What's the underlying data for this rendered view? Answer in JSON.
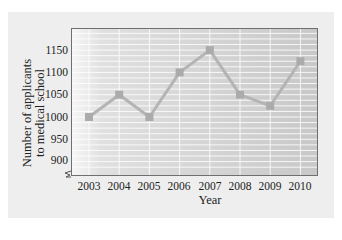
{
  "chart_data": {
    "type": "line",
    "title": "",
    "xlabel": "Year",
    "ylabel": "Number of applicants to medical school",
    "ylabel_lines": [
      "Number of applicants",
      "to medical school"
    ],
    "categories": [
      "2003",
      "2004",
      "2005",
      "2006",
      "2007",
      "2008",
      "2009",
      "2010"
    ],
    "series": [
      {
        "name": "Applicants",
        "values": [
          1000,
          1050,
          1000,
          1100,
          1150,
          1050,
          1025,
          1125
        ]
      }
    ],
    "yticks": [
      "900",
      "950",
      "1000",
      "1050",
      "1100",
      "1150"
    ],
    "ylim": [
      875,
      1200
    ],
    "axis_break": true,
    "grid": true,
    "legend": null,
    "colors": {
      "line": "#b4b4b4",
      "marker": "#ababab",
      "grid": "#ffffff",
      "frame": "#6f6f6f"
    }
  }
}
